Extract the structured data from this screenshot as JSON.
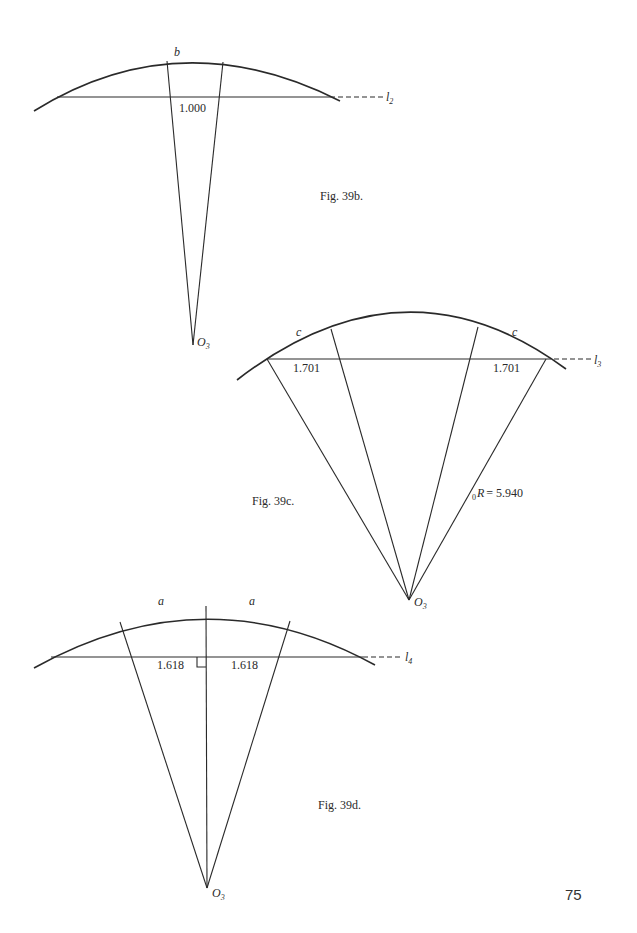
{
  "page": {
    "page_number": "75"
  },
  "figures": [
    {
      "id": "fig39b",
      "caption": "Fig. 39b.",
      "arc_label": "b",
      "chord_label": "1.000",
      "line_label": "l",
      "line_sub": "2",
      "center_label": "O",
      "center_sub": "3"
    },
    {
      "id": "fig39c",
      "caption": "Fig. 39c.",
      "arc_label_left": "c",
      "arc_label_right": "c",
      "chord_label_left": "1.701",
      "chord_label_right": "1.701",
      "radius_prefix_sub": "0",
      "radius_label": "R = 5.940",
      "line_label": "l",
      "line_sub": "3",
      "center_label": "O",
      "center_sub": "3"
    },
    {
      "id": "fig39d",
      "caption": "Fig. 39d.",
      "arc_label_left": "a",
      "arc_label_right": "a",
      "chord_label_left": "1.618",
      "chord_label_right": "1.618",
      "line_label": "l",
      "line_sub": "4",
      "center_label": "O",
      "center_sub": "3",
      "right_angle_marker": true
    }
  ]
}
